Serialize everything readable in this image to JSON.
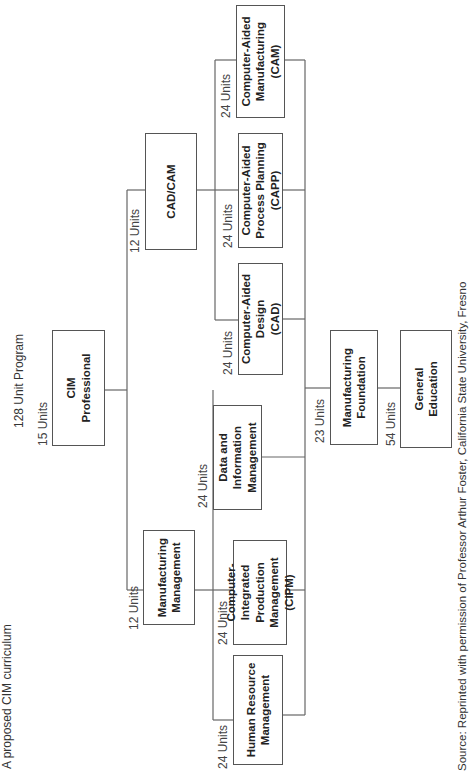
{
  "title": "A proposed CIM curriculum",
  "program_label": "128 Unit Program",
  "source": "Source: Reprinted with permission of Professor Arthur Foster, California State University, Fresno",
  "nodes": {
    "cim_professional": {
      "label": "CIM\nProfessional",
      "units": "15 Units"
    },
    "manufacturing_management": {
      "label": "Manufacturing\nManagement",
      "units": "12 Units"
    },
    "cad_cam": {
      "label": "CAD/CAM",
      "units": "12 Units"
    },
    "human_resource_management": {
      "label": "Human Resource\nManagement",
      "units": "24 Units"
    },
    "cipm": {
      "label": "Computer-Integrated\nProduction\nManagement (CIPM)",
      "units": "24 Units"
    },
    "data_information_management": {
      "label": "Data and\nInformation\nManagement",
      "units": "24 Units"
    },
    "cad": {
      "label": "Computer-Aided\nDesign\n(CAD)",
      "units": "24 Units"
    },
    "capp": {
      "label": "Computer-Aided\nProcess Planning\n(CAPP)",
      "units": "24 Units"
    },
    "cam": {
      "label": "Computer-Aided\nManufacturing\n(CAM)",
      "units": "24 Units"
    },
    "manufacturing_foundation": {
      "label": "Manufacturing\nFoundation",
      "units": "23 Units"
    },
    "general_education": {
      "label": "General\nEducation",
      "units": "54 Units"
    }
  },
  "colors": {
    "line": "#666666",
    "border": "#555555",
    "text": "#222222"
  }
}
